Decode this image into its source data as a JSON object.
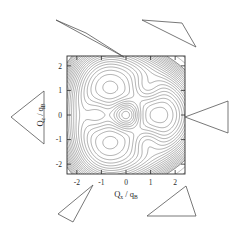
{
  "figure": {
    "kind": "contour-plot",
    "background_color": "#ffffff",
    "line_color": "#3a3a3a",
    "frame_color": "#2a2a2a"
  },
  "chart_data": {
    "type": "contour",
    "title": "",
    "subtitle": "",
    "xlabel": "Q_x / q_B",
    "ylabel": "Q_z / q_B",
    "xlabel_parts": {
      "main": "Q",
      "sub": "x",
      "sep": "/",
      "main2": "q",
      "sub2": "B"
    },
    "ylabel_parts": {
      "main": "Q",
      "sub": "z",
      "sep": "/",
      "main2": "q",
      "sub2": "B"
    },
    "xlim": [
      -2.4,
      2.4
    ],
    "ylim": [
      -2.4,
      2.4
    ],
    "xticks": [
      -2,
      -1,
      0,
      1,
      2
    ],
    "yticks": [
      -2,
      -1,
      0,
      1,
      2
    ],
    "xtick_labels": [
      "-2",
      "-1",
      "0",
      "1",
      "2"
    ],
    "ytick_labels": [
      "-2",
      "-1",
      "0",
      "1",
      "2"
    ],
    "grid": false,
    "legend": false,
    "legend_position": "none",
    "colorbar": false,
    "filled": false,
    "n_levels": 30,
    "extrema": [
      {
        "name": "central-maximum",
        "x": 0.0,
        "y": 0.0,
        "rings": 9
      },
      {
        "name": "left-extremum",
        "x": -1.12,
        "y": 0.0,
        "rings": 2
      },
      {
        "name": "upper-right-extremum",
        "x": 0.85,
        "y": 1.1,
        "rings": 2
      },
      {
        "name": "lower-right-extremum",
        "x": 0.85,
        "y": -1.1,
        "rings": 2
      }
    ],
    "levels": [
      0.05,
      0.1,
      0.15,
      0.2,
      0.25,
      0.3,
      0.35,
      0.4,
      0.45,
      0.5,
      0.55,
      0.6,
      0.65,
      0.7,
      0.75,
      0.8,
      0.85,
      0.9,
      0.95,
      1.0
    ]
  },
  "annotations": {
    "label": "pointer-triangles",
    "count": 6,
    "items": [
      {
        "name": "pointer-top-left",
        "position": "top-left",
        "points": "56,20 86,33 124,57"
      },
      {
        "name": "pointer-top-right",
        "position": "top-right",
        "points": "142,20 182,23 196,47"
      },
      {
        "name": "pointer-left",
        "position": "left",
        "points": "11,117 44,91 44,144"
      },
      {
        "name": "pointer-right",
        "position": "right",
        "points": "185,117 228,101 228,133"
      },
      {
        "name": "pointer-bottom-left",
        "position": "bottom-left",
        "points": "93,185 73,222 58,214"
      },
      {
        "name": "pointer-bottom-right",
        "position": "bottom-right",
        "points": "186,186 196,216 147,216"
      }
    ]
  },
  "plot_box": {
    "left": 67,
    "top": 56,
    "width": 118,
    "height": 118
  }
}
